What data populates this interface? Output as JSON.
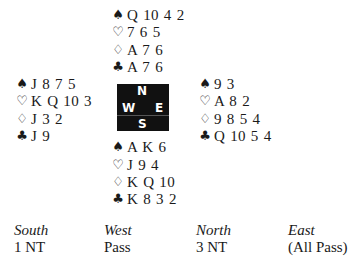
{
  "deal": {
    "suit_symbols": {
      "spades": "♠",
      "hearts": "♡",
      "diamonds": "♢",
      "clubs": "♣"
    },
    "north": {
      "spades": "Q 10 4 2",
      "hearts": "7 6 5",
      "diamonds": "A 7 6",
      "clubs": "A 7 6"
    },
    "west": {
      "spades": "J 8 7 5",
      "hearts": "K Q 10 3",
      "diamonds": "J 3 2",
      "clubs": "J 9"
    },
    "east": {
      "spades": "9 3",
      "hearts": "A 8 2",
      "diamonds": "9 8 5 4",
      "clubs": "Q 10 5 4"
    },
    "south": {
      "spades": "A K 6",
      "hearts": "J 9 4",
      "diamonds": "K Q 10",
      "clubs": "K 8 3 2"
    }
  },
  "compass": {
    "north": "N",
    "west": "W",
    "east": "E",
    "south": "S"
  },
  "bidding": {
    "headers": [
      "South",
      "West",
      "North",
      "East"
    ],
    "calls": [
      "1 NT",
      "Pass",
      "3 NT",
      "(All Pass)"
    ]
  }
}
